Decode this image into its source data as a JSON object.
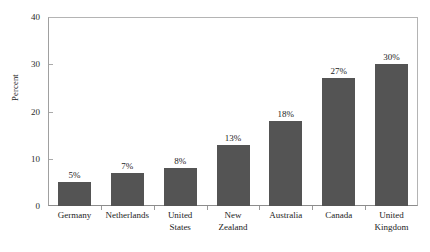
{
  "chart_data": {
    "type": "bar",
    "title": "",
    "subtitle": "",
    "xlabel": "",
    "ylabel": "Percent",
    "ylim": [
      0,
      40
    ],
    "yticks": [
      0,
      10,
      20,
      30,
      40
    ],
    "ytick_labels": [
      "0",
      "10",
      "20",
      "30",
      "40"
    ],
    "grid": false,
    "legend": null,
    "categories": [
      "Germany",
      "Netherlands",
      "United States",
      "New Zealand",
      "Australia",
      "Canada",
      "United Kingdom"
    ],
    "category_lines": [
      [
        "Germany"
      ],
      [
        "Netherlands"
      ],
      [
        "United",
        "States"
      ],
      [
        "New",
        "Zealand"
      ],
      [
        "Australia"
      ],
      [
        "Canada"
      ],
      [
        "United",
        "Kingdom"
      ]
    ],
    "values": [
      5,
      7,
      8,
      13,
      18,
      27,
      30
    ],
    "data_labels": [
      "5%",
      "7%",
      "8%",
      "13%",
      "18%",
      "27%",
      "30%"
    ],
    "colors": {
      "bar": "#545454",
      "axis": "#a8a8a8",
      "frame": "#b4b4b4",
      "text": "#1c1c1c",
      "background": "#ffffff"
    }
  }
}
